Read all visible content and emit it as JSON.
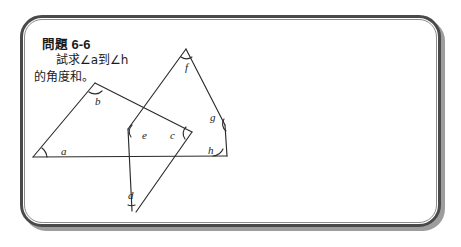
{
  "problem": {
    "label_cjk": "問題",
    "number": "6-6",
    "body_line1": "試求∠a到∠h",
    "body_line2": "的角度和。"
  },
  "figure": {
    "angle_labels": [
      "a",
      "b",
      "c",
      "d",
      "e",
      "f",
      "g",
      "h"
    ],
    "label_positions": {
      "a": {
        "x": 41,
        "y": 140
      },
      "b": {
        "x": 75,
        "y": 76
      },
      "c": {
        "x": 153,
        "y": 120
      },
      "d": {
        "x": 108,
        "y": 182
      },
      "e": {
        "x": 122,
        "y": 119
      },
      "f": {
        "x": 167,
        "y": 47
      },
      "g": {
        "x": 200,
        "y": 98
      },
      "h": {
        "x": 199,
        "y": 137
      }
    },
    "baseline": {
      "x1": 13,
      "y1": 142,
      "x2": 207,
      "y2": 141
    },
    "stroke_color": "#2b2b2b",
    "stroke_width": 1.1
  },
  "colors": {
    "page_background": "#ffffff",
    "frame_border": "#4a4a4a",
    "frame_inner_border": "#8b8b8b",
    "frame_shadow": "#9d9d9d",
    "ink": "#1b1b1b"
  }
}
